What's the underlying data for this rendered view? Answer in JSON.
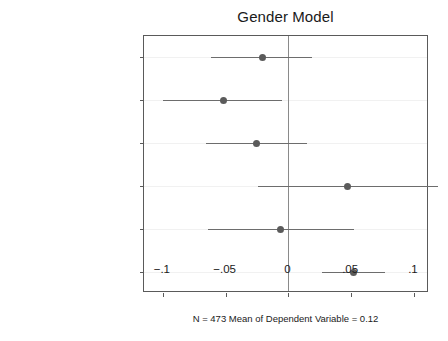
{
  "chart_data": {
    "type": "scatter",
    "title": "Gender Model",
    "xlabel": "",
    "ylabel": "",
    "caption": "N = 473 Mean of Dependent Variable = 0.12",
    "xlim": [
      -0.115,
      0.112
    ],
    "xticks": [
      -0.1,
      -0.05,
      0,
      0.05,
      0.1
    ],
    "xticklabels": [
      "−.1",
      "−.05",
      "0",
      ".05",
      ".1"
    ],
    "grid": true,
    "legend": "none",
    "reference_line": 0,
    "categories": [
      "Female, Same Party",
      "Male, Different Party",
      "Male, Same Party",
      "Nominee Qualifications",
      "Nominee Judge",
      "Senator Relection Year"
    ],
    "points": [
      {
        "label": "Female, Same Party",
        "estimate": -0.021,
        "ci_low": -0.062,
        "ci_high": 0.019
      },
      {
        "label": "Male, Different Party",
        "estimate": -0.052,
        "ci_low": -0.1,
        "ci_high": -0.005
      },
      {
        "label": "Male, Same Party",
        "estimate": -0.025,
        "ci_low": -0.066,
        "ci_high": 0.015
      },
      {
        "label": "Nominee Qualifications",
        "estimate": 0.047,
        "ci_low": -0.024,
        "ci_high": 0.119
      },
      {
        "label": "Nominee Judge",
        "estimate": -0.006,
        "ci_low": -0.064,
        "ci_high": 0.052
      },
      {
        "label": "Senator Relection Year",
        "estimate": 0.052,
        "ci_low": 0.027,
        "ci_high": 0.077
      }
    ],
    "colors": {
      "marker": "#5b5b5b",
      "ci_line": "#6d6d6d",
      "zero_line": "#8a8a8a",
      "frame": "#5a5a5a",
      "grid": "#f1f1f1",
      "text": "#1a1a1a",
      "background": "#ffffff"
    }
  }
}
